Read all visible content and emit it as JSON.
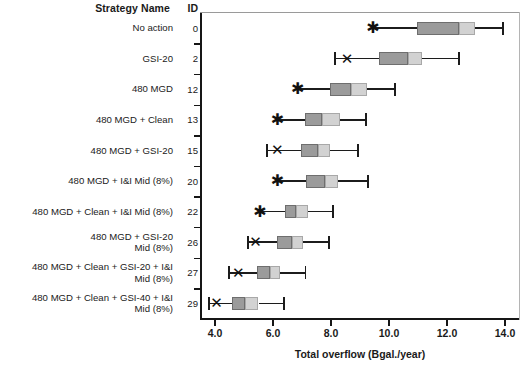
{
  "header": {
    "strategy_col": "Strategy Name",
    "id_col": "ID"
  },
  "axis": {
    "x_title": "Total overflow (Bgal./year)",
    "x_ticks": [
      "4.0",
      "6.0",
      "8.0",
      "10.0",
      "12.0",
      "14.0"
    ]
  },
  "chart_data": {
    "type": "box",
    "title": "",
    "xlabel": "Total overflow (Bgal./year)",
    "ylabel": "Strategy Name",
    "xlim": [
      3.3,
      14.8
    ],
    "xticks": [
      4.0,
      6.0,
      8.0,
      10.0,
      12.0,
      14.0
    ],
    "grid": false,
    "legend": "",
    "orientation": "horizontal",
    "marker_note": "X / asterisk marker denotes baseline point left of each box",
    "categories": [
      "No action",
      "GSI-20",
      "480 MGD",
      "480 MGD + Clean",
      "480 MGD + GSI-20",
      "480 MGD + I&I Mid (8%)",
      "480 MGD + Clean + I&I Mid (8%)",
      "480 MGD + GSI-20 + I&I Mid (8%)",
      "480 MGD + Clean + GSI-20 + I&I Mid (8%)",
      "480 MGD + Clean + GSI-40 + I&I Mid (8%)"
    ],
    "ids": [
      "0",
      "2",
      "12",
      "13",
      "15",
      "20",
      "22",
      "26",
      "27",
      "29"
    ],
    "boxes": [
      {
        "id": "0",
        "label": "No action",
        "whisker_low": 9.45,
        "q1": 10.95,
        "median": 12.4,
        "q3": 12.95,
        "whisker_high": 13.95,
        "marker": 9.45,
        "marker_glyph": "asterisk",
        "low_cap": false
      },
      {
        "id": "2",
        "label": "GSI-20",
        "whisker_low": 8.1,
        "q1": 9.65,
        "median": 10.65,
        "q3": 11.15,
        "whisker_high": 12.45,
        "marker": 8.55,
        "marker_glyph": "x",
        "low_cap": true
      },
      {
        "id": "12",
        "label": "480 MGD",
        "whisker_low": 6.85,
        "q1": 7.95,
        "median": 8.7,
        "q3": 9.25,
        "whisker_high": 10.25,
        "marker": 6.85,
        "marker_glyph": "asterisk",
        "low_cap": false
      },
      {
        "id": "13",
        "label": "480 MGD + Clean",
        "whisker_low": 6.15,
        "q1": 7.1,
        "median": 7.7,
        "q3": 8.3,
        "whisker_high": 9.25,
        "marker": 6.15,
        "marker_glyph": "asterisk",
        "low_cap": false
      },
      {
        "id": "15",
        "label": "480 MGD + GSI-20",
        "whisker_low": 5.75,
        "q1": 6.95,
        "median": 7.55,
        "q3": 7.95,
        "whisker_high": 8.95,
        "marker": 6.15,
        "marker_glyph": "x",
        "low_cap": true
      },
      {
        "id": "20",
        "label": "480 MGD + I&I Mid (8%)",
        "whisker_low": 6.15,
        "q1": 7.15,
        "median": 7.8,
        "q3": 8.25,
        "whisker_high": 9.3,
        "marker": 6.15,
        "marker_glyph": "asterisk",
        "low_cap": false
      },
      {
        "id": "22",
        "label": "480 MGD + Clean + I&I Mid (8%)",
        "whisker_low": 5.55,
        "q1": 6.4,
        "median": 6.8,
        "q3": 7.2,
        "whisker_high": 8.1,
        "marker": 5.55,
        "marker_glyph": "asterisk",
        "low_cap": false
      },
      {
        "id": "26",
        "label": "480 MGD + GSI-20 + I&I Mid (8%)",
        "whisker_low": 5.1,
        "q1": 6.15,
        "median": 6.65,
        "q3": 7.05,
        "whisker_high": 7.95,
        "marker": 5.4,
        "marker_glyph": "x",
        "low_cap": true
      },
      {
        "id": "27",
        "label": "480 MGD + Clean + GSI-20 + I&I Mid (8%)",
        "whisker_low": 4.45,
        "q1": 5.45,
        "median": 5.9,
        "q3": 6.25,
        "whisker_high": 7.15,
        "marker": 4.8,
        "marker_glyph": "x",
        "low_cap": true
      },
      {
        "id": "29",
        "label": "480 MGD + Clean + GSI-40 + I&I Mid (8%)",
        "whisker_low": 3.75,
        "q1": 4.6,
        "median": 5.05,
        "q3": 5.5,
        "whisker_high": 6.4,
        "marker": 4.05,
        "marker_glyph": "x",
        "low_cap": true
      }
    ],
    "colors": {
      "box_lower": "#9b9b9b",
      "box_upper": "#d2d2d2",
      "line": "#1c1c1c",
      "axis": "#161616"
    }
  }
}
